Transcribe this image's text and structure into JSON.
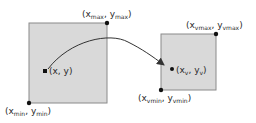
{
  "diagram": {
    "world_window": {
      "fill": "#d9d9d9",
      "stroke": "#8a8a8a",
      "max_label": {
        "open": "(x",
        "sub1": "max",
        "mid": ", y",
        "sub2": "max",
        "close": ")"
      },
      "min_label": {
        "open": "(x",
        "sub1": "min",
        "mid": ", y",
        "sub2": "min",
        "close": ")"
      },
      "point_label": "(x, y)"
    },
    "viewport": {
      "fill": "#d9d9d9",
      "stroke": "#8a8a8a",
      "max_label": {
        "open": "(x",
        "sub1": "vmax",
        "mid": ", y",
        "sub2": "vmax",
        "close": ")"
      },
      "min_label": {
        "open": "(x",
        "sub1": "vmin",
        "mid": ", y",
        "sub2": "vmin",
        "close": ")"
      },
      "point_label": {
        "open": "(x",
        "sub1": "v",
        "mid": ", y",
        "sub2": "v",
        "close": ")"
      }
    },
    "arrow": {
      "color": "#333333"
    }
  }
}
